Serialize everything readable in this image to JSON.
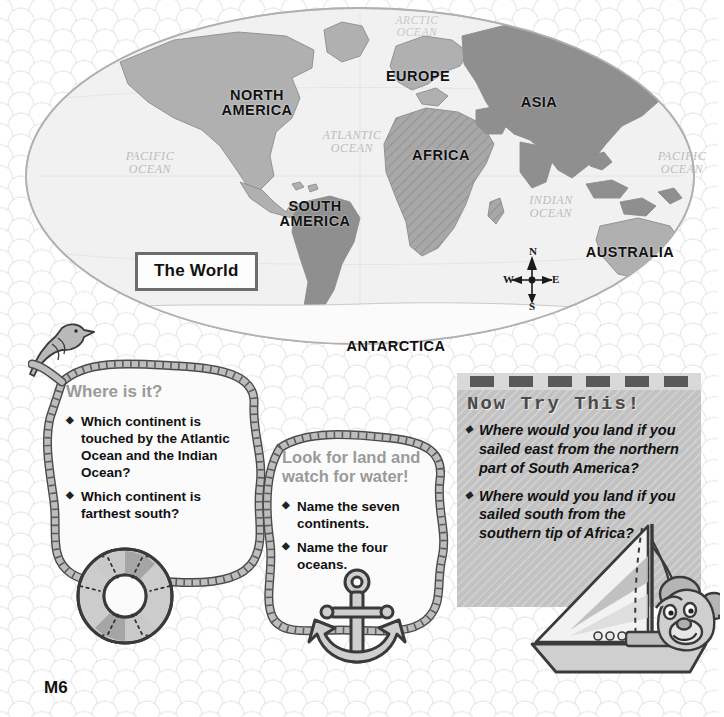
{
  "page": {
    "number": "M6"
  },
  "map": {
    "title": "The World",
    "continents": [
      {
        "name": "NORTH\nAMERICA"
      },
      {
        "name": "SOUTH\nAMERICA"
      },
      {
        "name": "EUROPE"
      },
      {
        "name": "AFRICA"
      },
      {
        "name": "ASIA"
      },
      {
        "name": "AUSTRALIA"
      },
      {
        "name": "ANTARCTICA"
      }
    ],
    "oceans": [
      {
        "name": "ARCTIC\nOCEAN"
      },
      {
        "name": "ATLANTIC\nOCEAN"
      },
      {
        "name": "PACIFIC\nOCEAN"
      },
      {
        "name": "PACIFIC\nOCEAN"
      },
      {
        "name": "INDIAN\nOCEAN"
      }
    ],
    "compass": {
      "north": "N",
      "south": "S",
      "west": "W",
      "east": "E"
    },
    "colors": {
      "land_light": "#b4b4b4",
      "land_dark": "#8f8f8f",
      "ocean": "#f0f0f0",
      "outline": "#9a9a9a"
    }
  },
  "rope_box_1": {
    "heading": "Where is it?",
    "bullet_glyph": "◆",
    "questions": [
      "Which continent is touched by the Atlantic Ocean and the Indian Ocean?",
      "Which continent is farthest south?"
    ]
  },
  "rope_box_2": {
    "heading": "Look for land and watch for water!",
    "bullet_glyph": "◆",
    "questions": [
      "Name the seven continents.",
      "Name the four oceans."
    ]
  },
  "now_try_this": {
    "title": "Now Try This!",
    "bullet_glyph": "◆",
    "band_dash_count": 6,
    "questions": [
      "Where would you land if you sailed east from the northern part of South America?",
      "Where would you land if you sailed south from the southern tip of Africa?"
    ],
    "colors": {
      "panel": "#c2c2c2",
      "band": "#d9d9d9",
      "dash": "#595959",
      "title_text": "#4a4a4a"
    }
  },
  "decorations": [
    {
      "name": "bird"
    },
    {
      "name": "life-ring"
    },
    {
      "name": "anchor"
    },
    {
      "name": "sailboat-with-bear"
    }
  ]
}
